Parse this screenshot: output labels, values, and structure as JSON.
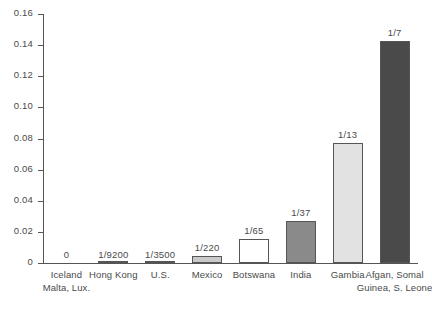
{
  "chart_data": {
    "type": "bar",
    "title": "",
    "subtitle": "",
    "xlabel": "",
    "ylabel": "",
    "ylim": [
      0,
      0.16
    ],
    "grid": false,
    "legend": "none",
    "y_ticks": [
      "0.16",
      "0.14",
      "0.12",
      "0.10",
      "0.08",
      "0.06",
      "0.04",
      "0.02",
      "0"
    ],
    "y_tick_values": [
      0.16,
      0.14,
      0.12,
      0.1,
      0.08,
      0.06,
      0.04,
      0.02,
      0
    ],
    "categories": [
      "Iceland",
      "Hong Kong",
      "U.S.",
      "Mexico",
      "Botswana",
      "India",
      "Gambia",
      "Afgan, Somal"
    ],
    "category_second_lines": [
      "Malta, Lux.",
      "",
      "",
      "",
      "",
      "",
      "",
      "Guinea, S. Leone"
    ],
    "data_labels": [
      "0",
      "1/9200",
      "1/3500",
      "1/220",
      "1/65",
      "1/37",
      "1/13",
      "1/7"
    ],
    "values": [
      0,
      0.000109,
      0.000286,
      0.004545,
      0.015385,
      0.027027,
      0.076923,
      0.142857
    ],
    "fill_colors": [
      "#ffffff",
      "#4a4a4a",
      "#4a4a4a",
      "#c9c9c9",
      "#ffffff",
      "#8a8a8a",
      "#e2e2e2",
      "#4a4a4a"
    ],
    "edge_color": "#555555",
    "axis_color": "#555555",
    "text_color": "#4a4a4a",
    "background": "#ffffff"
  }
}
